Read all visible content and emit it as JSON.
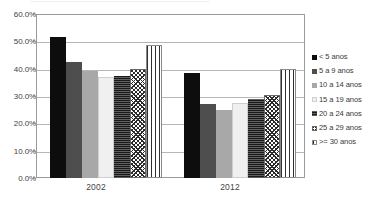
{
  "chart_data": {
    "type": "bar",
    "title": "",
    "subtitle": "",
    "xlabel": "",
    "ylabel": "",
    "categories": [
      "2002",
      "2012"
    ],
    "ylim": [
      0,
      60
    ],
    "ytick_labels": [
      "60.0%",
      "50.0%",
      "40.0%",
      "30.0%",
      "20.0%",
      "10.0%",
      "0.0%"
    ],
    "ytick_values": [
      60,
      50,
      40,
      30,
      20,
      10,
      0
    ],
    "grid": true,
    "legend_position": "right",
    "value_suffix": "%",
    "series": [
      {
        "name": "< 5 anos",
        "pattern": "solid-black",
        "color": "#0d0d0d",
        "values": [
          51.5,
          38.5
        ]
      },
      {
        "name": "5 a 9 anos",
        "pattern": "solid-dark-gray",
        "color": "#4e4e4e",
        "values": [
          42.5,
          27.0
        ]
      },
      {
        "name": "10 a 14 anos",
        "pattern": "solid-mid-gray",
        "color": "#a8a8a8",
        "values": [
          39.0,
          25.0
        ]
      },
      {
        "name": "15 a 19 anos",
        "pattern": "solid-light-gray",
        "color": "#f0f0f0",
        "values": [
          37.0,
          27.5
        ]
      },
      {
        "name": "20 a 24 anos",
        "pattern": "fine-horizontal-dots",
        "color": "#1a1a1a",
        "values": [
          37.5,
          29.0
        ]
      },
      {
        "name": "25 a 29 anos",
        "pattern": "crosshatch",
        "color": "#2b2b2b",
        "values": [
          40.0,
          30.5
        ]
      },
      {
        "name": ">= 30 anos",
        "pattern": "vertical-stripes",
        "color": "#2f2f2f",
        "values": [
          48.5,
          40.0
        ]
      }
    ]
  },
  "legend": {
    "items": [
      {
        "label": "< 5 anos"
      },
      {
        "label": "5 a 9 anos"
      },
      {
        "label": "10 a 14 anos"
      },
      {
        "label": "15 a 19 anos"
      },
      {
        "label": "20 a 24 anos"
      },
      {
        "label": "25 a 29 anos"
      },
      {
        "label": ">= 30 anos"
      }
    ]
  }
}
